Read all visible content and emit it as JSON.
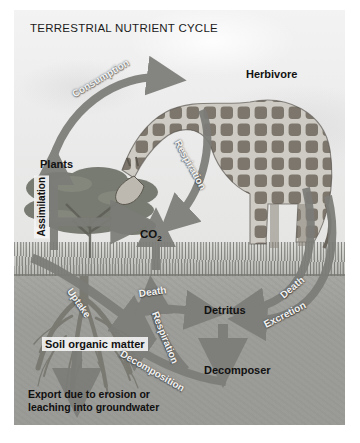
{
  "figure": {
    "title": "TERRESTRIAL NUTRIENT CYCLE",
    "style": {
      "sky_color": "#ededed",
      "grass_color": "#c9c9c5",
      "soil_color": "#9d9d99",
      "arrow_color": "#7c7c78",
      "arrow_dark_color": "#6e6e6a",
      "label_color": "#121212",
      "flow_label_color": "#f2f2f2"
    }
  },
  "nodes": [
    {
      "id": "plants",
      "label": "Plants"
    },
    {
      "id": "herbivore",
      "label": "Herbivore"
    },
    {
      "id": "co2",
      "label": "CO2",
      "label_html": "CO₂"
    },
    {
      "id": "detritus",
      "label": "Detritus"
    },
    {
      "id": "decomposer",
      "label": "Decomposer"
    },
    {
      "id": "soil-organic-matter",
      "label": "Soil organic matter"
    }
  ],
  "flows": [
    {
      "id": "consumption",
      "label": "Consumption",
      "from": "plants",
      "to": "herbivore"
    },
    {
      "id": "respiration-plant",
      "label": "Respiration",
      "from": "herbivore",
      "to": "co2"
    },
    {
      "id": "assimilation",
      "label": "Assimilation",
      "from": "soil-organic-matter",
      "to": "plants"
    },
    {
      "id": "uptake",
      "label": "Uptake",
      "from": "soil-organic-matter",
      "to": "plants"
    },
    {
      "id": "death-plant",
      "label": "Death",
      "from": "plants",
      "to": "detritus"
    },
    {
      "id": "death-herbivore",
      "label": "Death",
      "from": "herbivore",
      "to": "detritus"
    },
    {
      "id": "excretion",
      "label": "Excretion",
      "from": "herbivore",
      "to": "detritus"
    },
    {
      "id": "decomposition",
      "label": "Decomposition",
      "from": "decomposer",
      "to": "soil-organic-matter"
    },
    {
      "id": "respiration-decomposer",
      "label": "Respiration",
      "from": "decomposer",
      "to": "co2"
    }
  ],
  "captions": {
    "export_line1": "Export due to erosion or",
    "export_line2": "leaching into groundwater"
  }
}
